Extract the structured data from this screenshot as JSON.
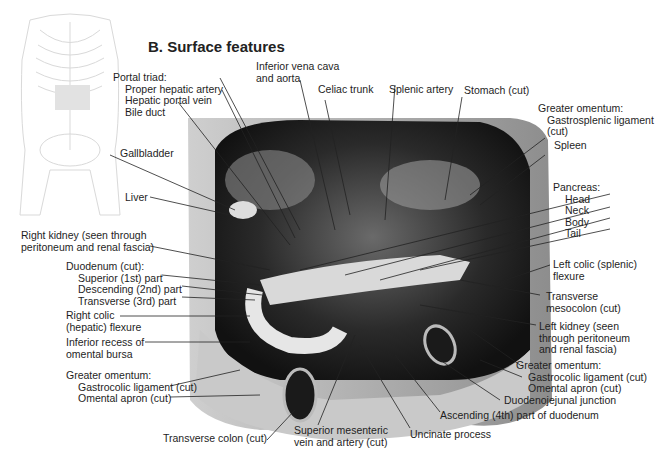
{
  "title": "B. Surface features",
  "thumbnail": {
    "name": "torso-skeleton-orientation-figure"
  },
  "labels": {
    "portal_triad": {
      "heading": "Portal triad:",
      "items": [
        "Proper hepatic artery",
        "Hepatic portal vein",
        "Bile duct"
      ]
    },
    "ivc_aorta": [
      "Inferior vena cava",
      "and aorta"
    ],
    "celiac_trunk": "Celiac trunk",
    "splenic_artery": "Splenic artery",
    "stomach_cut": "Stomach (cut)",
    "greater_omentum_top": {
      "heading": "Greater omentum:",
      "items": [
        "Gastrosplenic ligament",
        "(cut)"
      ]
    },
    "spleen": "Spleen",
    "pancreas": {
      "heading": "Pancreas:",
      "items": [
        "Head",
        "Neck",
        "Body",
        "Tail"
      ]
    },
    "left_colic_flexure": [
      "Left colic (splenic)",
      "flexure"
    ],
    "transverse_mesocolon": [
      "Transverse",
      "mesocolon (cut)"
    ],
    "left_kidney": [
      "Left kidney (seen",
      "through peritoneum",
      "and renal fascia)"
    ],
    "greater_omentum_right": {
      "heading": "Greater omentum:",
      "items": [
        "Gastrocolic ligament (cut)",
        "Omental apron (cut)"
      ]
    },
    "duodenojejunal_junction": "Duodenojejunal junction",
    "ascending_duodenum": "Ascending (4th) part of duodenum",
    "uncinate_process": "Uncinate process",
    "sup_mesenteric": [
      "Superior mesenteric",
      "vein and artery (cut)"
    ],
    "transverse_colon": "Transverse colon (cut)",
    "greater_omentum_left": {
      "heading": "Greater omentum:",
      "items": [
        "Gastrocolic ligament (cut)",
        "Omental apron (cut)"
      ]
    },
    "inferior_recess": [
      "Inferior recess of",
      "omental bursa"
    ],
    "right_colic_flexure": [
      "Right colic",
      "(hepatic) flexure"
    ],
    "duodenum": {
      "heading": "Duodenum (cut):",
      "items": [
        "Superior (1st) part",
        "Descending (2nd) part",
        "Transverse (3rd) part"
      ]
    },
    "right_kidney": [
      "Right kidney (seen through",
      "peritoneum and renal fascia)"
    ],
    "liver": "Liver",
    "gallbladder": "Gallbladder"
  }
}
